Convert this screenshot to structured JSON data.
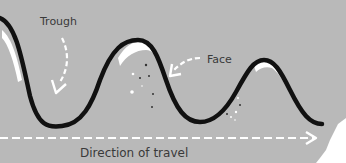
{
  "diagram": {
    "labels": {
      "trough": "Trough",
      "face": "Face",
      "direction": "Direction of travel"
    },
    "colors": {
      "background": "#b9b9b9",
      "wave_line": "#111111",
      "arrow": "#ffffff",
      "text": "#3a3a3a",
      "foam": "#ffffff"
    }
  }
}
